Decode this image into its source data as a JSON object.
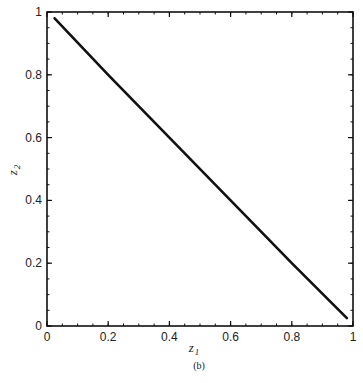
{
  "chart_data": {
    "type": "line",
    "title": "",
    "caption": "(b)",
    "xlabel": "z",
    "xlabel_sub": "1",
    "ylabel": "z",
    "ylabel_sub": "2",
    "xlim": [
      0,
      1
    ],
    "ylim": [
      0,
      1
    ],
    "xticks": [
      0,
      0.2,
      0.4,
      0.6,
      0.8,
      1
    ],
    "yticks": [
      0,
      0.2,
      0.4,
      0.6,
      0.8,
      1
    ],
    "xtick_labels": [
      "0",
      "0.2",
      "0.4",
      "0.6",
      "0.8",
      "1"
    ],
    "ytick_labels": [
      "0",
      "0.2",
      "0.4",
      "0.6",
      "0.8",
      "1"
    ],
    "grid": false,
    "legend": null,
    "series": [
      {
        "name": "z2 vs z1",
        "x": [
          0.025,
          0.2,
          0.4,
          0.6,
          0.8,
          0.98
        ],
        "y": [
          0.98,
          0.8,
          0.6,
          0.4,
          0.2,
          0.025
        ]
      }
    ],
    "line_color": "#111111"
  }
}
